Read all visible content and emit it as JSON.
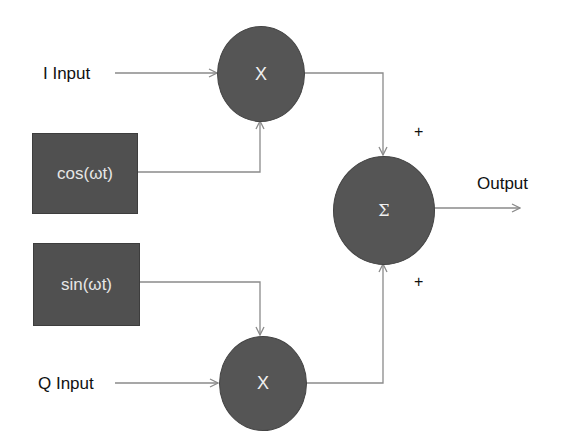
{
  "diagram": {
    "type": "IQ modulator block diagram",
    "inputs": {
      "i_input": "I Input",
      "q_input": "Q Input"
    },
    "oscillators": {
      "cos": "cos(ωt)",
      "sin": "sin(ωt)"
    },
    "multipliers": {
      "top": "X",
      "bottom": "X"
    },
    "summer": {
      "symbol": "Σ",
      "top_sign": "+",
      "bottom_sign": "+"
    },
    "output": "Output",
    "colors": {
      "block_fill": "#555555",
      "block_text": "#f0f0f0",
      "line": "#8a8a8a",
      "label_text": "#111111"
    }
  }
}
